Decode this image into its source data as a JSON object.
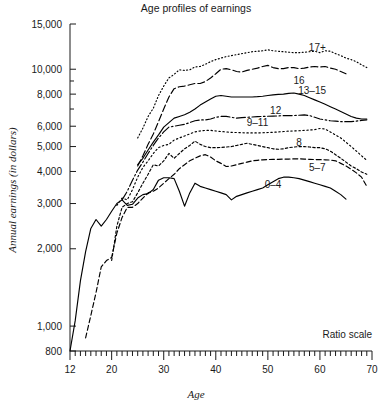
{
  "chart_data": {
    "type": "line",
    "title": "Age profiles of earnings",
    "xlabel": "Age",
    "ylabel": "Annual earnings (in dollars)",
    "note": "Ratio scale",
    "yscale": "log",
    "xlim": [
      12,
      70
    ],
    "ylim": [
      800,
      15000
    ],
    "grid": false,
    "legend_position": "inline-right",
    "xticks_major": [
      12,
      20,
      30,
      40,
      50,
      60,
      70
    ],
    "xticks_major_labels": [
      "12",
      "20",
      "30",
      "40",
      "50",
      "60",
      "70"
    ],
    "xtick_minor_step": 1,
    "yticks": [
      800,
      1000,
      2000,
      3000,
      4000,
      5000,
      6000,
      8000,
      10000,
      15000
    ],
    "ytick_labels": [
      "800",
      "1,000",
      "2,000",
      "3,000",
      "4,000",
      "5,000",
      "6,000",
      "8,000",
      "10,000",
      "15,000"
    ],
    "yticks_minor": [
      7000,
      9000
    ],
    "series": [
      {
        "name": "17+",
        "label": "17+",
        "dash": "1,2.4",
        "label_x": 59.5,
        "label_y": 12200,
        "x": [
          25,
          26,
          27,
          28,
          29,
          30,
          31,
          32,
          33,
          34,
          35,
          36,
          37,
          38,
          39,
          40,
          41,
          42,
          43,
          44,
          45,
          46,
          47,
          48,
          49,
          50,
          51,
          52,
          53,
          54,
          55,
          56,
          57,
          58,
          59,
          60,
          61,
          62,
          63,
          64,
          65,
          66,
          67,
          68,
          69
        ],
        "y": [
          5400,
          5900,
          6550,
          7050,
          7900,
          8600,
          9250,
          9550,
          9950,
          9900,
          9950,
          10200,
          10250,
          10450,
          10700,
          10900,
          11050,
          11200,
          11300,
          11400,
          11500,
          11600,
          11700,
          11750,
          11800,
          11900,
          11800,
          11750,
          11700,
          11650,
          11600,
          11600,
          11650,
          11700,
          11750,
          11600,
          11800,
          11750,
          11500,
          11300,
          11050,
          10900,
          10700,
          10400,
          10150
        ]
      },
      {
        "name": "16",
        "label": "16",
        "dash": "7,3",
        "label_x": 56.0,
        "label_y": 9050,
        "x": [
          25,
          26,
          27,
          28,
          29,
          30,
          31,
          32,
          33,
          34,
          35,
          36,
          37,
          38,
          39,
          40,
          41,
          42,
          43,
          44,
          45,
          46,
          47,
          48,
          49,
          50,
          51,
          52,
          53,
          54,
          55,
          56,
          57,
          58,
          59,
          60,
          61,
          62,
          63,
          64,
          65
        ],
        "y": [
          4200,
          4600,
          5100,
          5600,
          6250,
          7000,
          7800,
          8400,
          8550,
          8600,
          8700,
          8800,
          8800,
          8950,
          9250,
          9600,
          10000,
          10050,
          9950,
          9800,
          9750,
          9900,
          10000,
          10100,
          10250,
          10350,
          10150,
          10050,
          10050,
          10150,
          10150,
          10050,
          10100,
          10200,
          10250,
          10200,
          10250,
          10100,
          10000,
          9800,
          9600
        ]
      },
      {
        "name": "13-15",
        "label": "13–15",
        "dash": "none",
        "label_x": 58.5,
        "label_y": 8250,
        "x": [
          25,
          26,
          27,
          28,
          29,
          30,
          31,
          32,
          33,
          34,
          35,
          36,
          37,
          38,
          39,
          40,
          41,
          42,
          43,
          44,
          45,
          46,
          47,
          48,
          49,
          50,
          51,
          52,
          53,
          54,
          55,
          56,
          57,
          58,
          59,
          60,
          61,
          62,
          63,
          64,
          65,
          66,
          67,
          68,
          69
        ],
        "y": [
          4250,
          4500,
          4850,
          5200,
          5550,
          5950,
          6200,
          6450,
          6550,
          6650,
          6800,
          7000,
          7250,
          7450,
          7650,
          7850,
          7900,
          7850,
          7800,
          7800,
          7800,
          7800,
          7800,
          7820,
          7850,
          7900,
          7950,
          7980,
          8000,
          8050,
          8080,
          8000,
          7900,
          7750,
          7600,
          7450,
          7300,
          7150,
          7000,
          6850,
          6700,
          6550,
          6450,
          6400,
          6400
        ]
      },
      {
        "name": "12",
        "label": "12",
        "dash": "9,2.5,1.6,2.5",
        "label_x": 51.5,
        "label_y": 6900,
        "x": [
          22,
          23,
          24,
          25,
          26,
          27,
          28,
          29,
          30,
          31,
          32,
          33,
          34,
          35,
          36,
          37,
          38,
          39,
          40,
          41,
          42,
          43,
          44,
          45,
          46,
          47,
          48,
          49,
          50,
          51,
          52,
          53,
          54,
          55,
          56,
          57,
          58,
          59,
          60,
          61,
          62,
          63,
          64,
          65,
          66,
          67,
          68,
          69
        ],
        "y": [
          3100,
          3350,
          3700,
          4050,
          4350,
          4700,
          5050,
          5400,
          5700,
          5950,
          6000,
          6050,
          6100,
          6200,
          6300,
          6350,
          6350,
          6400,
          6500,
          6550,
          6550,
          6500,
          6450,
          6480,
          6500,
          6520,
          6540,
          6550,
          6560,
          6570,
          6580,
          6600,
          6600,
          6600,
          6620,
          6640,
          6600,
          6500,
          6400,
          6350,
          6300,
          6280,
          6250,
          6250,
          6250,
          6280,
          6320,
          6350
        ]
      },
      {
        "name": "9-11",
        "label": "9–11",
        "dash": "1.4,2.6",
        "label_x": 48.0,
        "label_y": 6200,
        "x": [
          21,
          22,
          23,
          24,
          25,
          26,
          27,
          28,
          29,
          30,
          31,
          32,
          33,
          34,
          35,
          36,
          37,
          38,
          39,
          40,
          41,
          42,
          43,
          44,
          45,
          46,
          47,
          48,
          49,
          50,
          51,
          52,
          53,
          54,
          55,
          56,
          57,
          58,
          59,
          60,
          61,
          62,
          63,
          64,
          65,
          66,
          67,
          68,
          69
        ],
        "y": [
          2950,
          3150,
          3100,
          3400,
          3800,
          4150,
          4400,
          4700,
          4950,
          5050,
          5100,
          5300,
          5400,
          5500,
          5600,
          5700,
          5750,
          5780,
          5780,
          5750,
          5720,
          5700,
          5680,
          5670,
          5660,
          5650,
          5650,
          5650,
          5660,
          5670,
          5680,
          5700,
          5720,
          5740,
          5750,
          5760,
          5780,
          5800,
          5820,
          5880,
          5850,
          5700,
          5550,
          5400,
          5200,
          5000,
          4800,
          4600,
          4420
        ]
      },
      {
        "name": "8",
        "label": "8",
        "dash": "2.4,2.2",
        "label_x": 56.0,
        "label_y": 5200,
        "x": [
          20,
          21,
          22,
          23,
          24,
          25,
          26,
          27,
          28,
          29,
          30,
          31,
          32,
          33,
          34,
          35,
          36,
          37,
          38,
          39,
          40,
          41,
          42,
          43,
          44,
          45,
          46,
          47,
          48,
          49,
          50,
          51,
          52,
          53,
          54,
          55,
          56,
          57,
          58,
          59,
          60,
          61,
          62,
          63,
          64,
          65,
          66,
          67,
          68,
          69
        ],
        "y": [
          1800,
          2450,
          2900,
          3000,
          3050,
          3300,
          3600,
          3900,
          4250,
          4200,
          4400,
          4700,
          4500,
          4700,
          4900,
          5050,
          5250,
          5100,
          5000,
          4950,
          4950,
          4960,
          4980,
          5000,
          5050,
          5100,
          5150,
          5100,
          5050,
          5000,
          4950,
          4900,
          4880,
          4900,
          4950,
          4980,
          5000,
          5000,
          4980,
          4950,
          4950,
          4900,
          4800,
          4650,
          4500,
          4350,
          4200,
          4100,
          3980,
          3900
        ]
      },
      {
        "name": "5-7",
        "label": "5–7",
        "dash": "5,2.8",
        "label_x": 59.5,
        "label_y": 4150,
        "x": [
          15,
          16,
          17,
          18,
          19,
          20,
          21,
          22,
          23,
          24,
          25,
          26,
          27,
          28,
          29,
          30,
          31,
          32,
          33,
          34,
          35,
          36,
          37,
          38,
          39,
          40,
          41,
          42,
          43,
          44,
          45,
          46,
          47,
          48,
          49,
          50,
          51,
          52,
          53,
          54,
          55,
          56,
          57,
          58,
          59,
          60,
          61,
          62,
          63,
          64,
          65,
          66,
          67,
          68,
          69
        ],
        "y": [
          900,
          1100,
          1350,
          1700,
          1800,
          1850,
          2300,
          2650,
          2900,
          2900,
          3000,
          3150,
          3300,
          3350,
          3450,
          3600,
          3750,
          3900,
          4100,
          4250,
          4400,
          4500,
          4600,
          4650,
          4550,
          4400,
          4300,
          4180,
          4200,
          4250,
          4300,
          4350,
          4400,
          4420,
          4440,
          4450,
          4460,
          4460,
          4470,
          4470,
          4480,
          4480,
          4470,
          4460,
          4450,
          4450,
          4440,
          4430,
          4400,
          4300,
          4200,
          4080,
          3950,
          3800,
          3500
        ]
      },
      {
        "name": "0-4",
        "label": "0–4",
        "dash": "none",
        "label_x": 51.0,
        "label_y": 3550,
        "x": [
          12,
          13,
          14,
          15,
          16,
          17,
          18,
          19,
          20,
          21,
          22,
          23,
          24,
          25,
          26,
          27,
          28,
          29,
          30,
          31,
          32,
          33,
          34,
          35,
          36,
          37,
          38,
          39,
          40,
          41,
          42,
          43,
          44,
          45,
          46,
          47,
          48,
          49,
          50,
          51,
          52,
          53,
          54,
          55,
          56,
          57,
          58,
          59,
          60,
          61,
          62,
          63,
          64,
          65
        ],
        "y": [
          800,
          1050,
          1500,
          1950,
          2400,
          2600,
          2450,
          2600,
          2800,
          3000,
          3100,
          2950,
          2980,
          3150,
          3250,
          3280,
          3400,
          3700,
          3780,
          3780,
          3750,
          3350,
          2930,
          3300,
          3600,
          3500,
          3450,
          3400,
          3350,
          3300,
          3250,
          3100,
          3200,
          3250,
          3300,
          3350,
          3400,
          3450,
          3550,
          3650,
          3750,
          3800,
          3800,
          3780,
          3750,
          3700,
          3650,
          3600,
          3550,
          3500,
          3450,
          3350,
          3250,
          3120
        ]
      }
    ]
  }
}
